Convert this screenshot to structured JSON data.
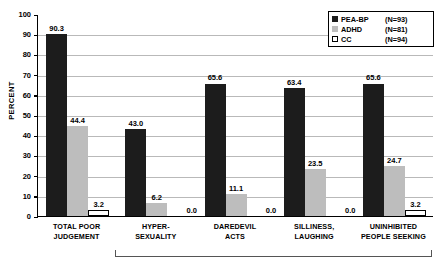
{
  "chart_data": {
    "type": "bar",
    "title": "",
    "xlabel": "",
    "ylabel": "PERCENT",
    "ylim": [
      0,
      100
    ],
    "ytick_step": 10,
    "yticks": [
      "0",
      "10",
      "20",
      "30",
      "40",
      "50",
      "60",
      "70",
      "80",
      "90",
      "100"
    ],
    "grid": true,
    "legend_position": "top-right",
    "categories": [
      "TOTAL POOR JUDGEMENT",
      "HYPER-SEXUALITY",
      "DAREDEVIL ACTS",
      "SILLINESS, LAUGHING",
      "UNINHIBITED PEOPLE SEEKING"
    ],
    "category_lines": [
      [
        "TOTAL POOR",
        "JUDGEMENT"
      ],
      [
        "HYPER-",
        "SEXUALITY"
      ],
      [
        "DAREDEVIL",
        "ACTS"
      ],
      [
        "SILLINESS,",
        "LAUGHING"
      ],
      [
        "UNINHIBITED",
        "PEOPLE SEEKING"
      ]
    ],
    "series": [
      {
        "name": "PEA-BP",
        "n_label": "(N=93)",
        "color": "#1c1c1c",
        "values": [
          90.3,
          43.0,
          65.6,
          63.4,
          65.6
        ],
        "labels": [
          "90.3",
          "43.0",
          "65.6",
          "63.4",
          "65.6"
        ]
      },
      {
        "name": "ADHD",
        "n_label": "(N=81)",
        "color": "#bdbdbd",
        "values": [
          44.4,
          6.2,
          11.1,
          23.5,
          24.7
        ],
        "labels": [
          "44.4",
          "6.2",
          "11.1",
          "23.5",
          "24.7"
        ]
      },
      {
        "name": "CC",
        "n_label": "(N=94)",
        "color": "#ffffff",
        "values": [
          3.2,
          0.0,
          0.0,
          0.0,
          3.2
        ],
        "labels": [
          "3.2",
          "0.0",
          "0.0",
          "0.0",
          "3.2"
        ]
      }
    ],
    "annotations": {
      "bracket": "spans HYPER-SEXUALITY through UNINHIBITED PEOPLE SEEKING"
    }
  }
}
